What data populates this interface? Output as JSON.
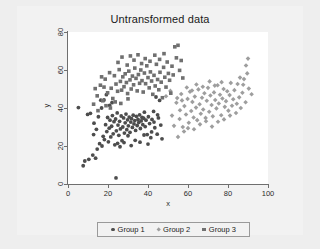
{
  "figure": {
    "background_color": "#eeeeee",
    "canvas_color": "#f2f2f2",
    "plot_color": "#ffffff"
  },
  "chart_data": {
    "type": "scatter",
    "title": "Untransformed data",
    "xlabel": "x",
    "ylabel": "y",
    "xlim": [
      0,
      100
    ],
    "ylim": [
      0,
      80
    ],
    "xticks": [
      0,
      20,
      40,
      60,
      80,
      100
    ],
    "yticks": [
      0,
      20,
      40,
      60,
      80
    ],
    "grid": false,
    "legend_position": "bottom",
    "series": [
      {
        "name": "Group 1",
        "marker": "circle",
        "color": "#4d4d4d",
        "points": [
          [
            5.2,
            40.2
          ],
          [
            7.6,
            9.6
          ],
          [
            8.4,
            12.1
          ],
          [
            9.8,
            36.6
          ],
          [
            10.4,
            13.0
          ],
          [
            11.2,
            37.2
          ],
          [
            12.4,
            15.2
          ],
          [
            13.0,
            32.0
          ],
          [
            13.8,
            13.6
          ],
          [
            14.6,
            18.4
          ],
          [
            15.2,
            35.4
          ],
          [
            15.8,
            21.2
          ],
          [
            16.4,
            44.1
          ],
          [
            17.0,
            20.0
          ],
          [
            17.6,
            25.1
          ],
          [
            18.2,
            23.4
          ],
          [
            18.8,
            31.2
          ],
          [
            19.4,
            27.6
          ],
          [
            19.8,
            35.0
          ],
          [
            20.2,
            22.2
          ],
          [
            20.6,
            29.4
          ],
          [
            21.0,
            33.6
          ],
          [
            21.4,
            24.8
          ],
          [
            21.8,
            30.4
          ],
          [
            22.2,
            36.0
          ],
          [
            22.6,
            26.4
          ],
          [
            23.0,
            32.8
          ],
          [
            23.4,
            20.6
          ],
          [
            23.8,
            34.2
          ],
          [
            24.0,
            3.2
          ],
          [
            24.2,
            28.0
          ],
          [
            24.6,
            37.4
          ],
          [
            25.0,
            31.0
          ],
          [
            25.4,
            25.6
          ],
          [
            25.8,
            33.0
          ],
          [
            26.2,
            29.0
          ],
          [
            26.6,
            35.8
          ],
          [
            27.0,
            22.8
          ],
          [
            27.4,
            30.0
          ],
          [
            27.8,
            34.8
          ],
          [
            28.2,
            26.8
          ],
          [
            28.6,
            32.2
          ],
          [
            29.0,
            36.8
          ],
          [
            29.4,
            28.6
          ],
          [
            29.8,
            33.8
          ],
          [
            30.2,
            30.6
          ],
          [
            30.6,
            35.2
          ],
          [
            31.0,
            27.2
          ],
          [
            31.4,
            32.6
          ],
          [
            31.8,
            34.4
          ],
          [
            32.2,
            29.8
          ],
          [
            32.6,
            36.2
          ],
          [
            33.0,
            31.6
          ],
          [
            33.4,
            33.4
          ],
          [
            33.8,
            28.2
          ],
          [
            34.2,
            35.6
          ],
          [
            34.6,
            30.8
          ],
          [
            35.0,
            34.0
          ],
          [
            35.4,
            32.4
          ],
          [
            35.8,
            36.4
          ],
          [
            36.2,
            29.2
          ],
          [
            36.6,
            33.2
          ],
          [
            37.0,
            35.0
          ],
          [
            37.4,
            31.2
          ],
          [
            37.8,
            34.6
          ],
          [
            38.2,
            37.8
          ],
          [
            38.6,
            30.2
          ],
          [
            39.0,
            33.6
          ],
          [
            39.6,
            26.0
          ],
          [
            40.2,
            35.4
          ],
          [
            40.8,
            31.8
          ],
          [
            41.4,
            24.4
          ],
          [
            42.0,
            34.0
          ],
          [
            42.8,
            38.2
          ],
          [
            43.4,
            29.6
          ],
          [
            44.0,
            45.8
          ],
          [
            44.6,
            26.2
          ],
          [
            45.2,
            34.8
          ],
          [
            45.8,
            44.0
          ],
          [
            46.4,
            31.0
          ],
          [
            47.0,
            23.8
          ],
          [
            12.8,
            26.0
          ],
          [
            14.2,
            28.8
          ],
          [
            16.8,
            40.0
          ],
          [
            18.0,
            44.2
          ],
          [
            19.2,
            47.0
          ],
          [
            20.8,
            41.4
          ],
          [
            22.0,
            42.8
          ],
          [
            24.8,
            21.4
          ],
          [
            26.0,
            19.6
          ],
          [
            28.0,
            21.8
          ],
          [
            30.0,
            25.4
          ],
          [
            31.6,
            20.2
          ],
          [
            33.6,
            23.0
          ],
          [
            36.0,
            22.0
          ],
          [
            38.0,
            25.8
          ],
          [
            40.0,
            21.0
          ],
          [
            41.8,
            27.4
          ],
          [
            43.0,
            32.6
          ],
          [
            44.8,
            36.4
          ]
        ]
      },
      {
        "name": "Group 2",
        "marker": "diamond",
        "color": "#9e9e9e",
        "points": [
          [
            49.0,
            46.2
          ],
          [
            51.2,
            49.0
          ],
          [
            53.0,
            30.6
          ],
          [
            54.2,
            42.8
          ],
          [
            55.0,
            24.8
          ],
          [
            55.8,
            34.2
          ],
          [
            56.6,
            47.4
          ],
          [
            57.4,
            30.0
          ],
          [
            58.2,
            41.0
          ],
          [
            59.0,
            36.6
          ],
          [
            59.8,
            44.8
          ],
          [
            60.4,
            32.2
          ],
          [
            61.0,
            48.6
          ],
          [
            61.6,
            38.4
          ],
          [
            62.2,
            43.2
          ],
          [
            62.8,
            35.0
          ],
          [
            63.4,
            46.0
          ],
          [
            64.0,
            40.2
          ],
          [
            64.6,
            33.6
          ],
          [
            65.2,
            49.8
          ],
          [
            65.8,
            42.0
          ],
          [
            66.4,
            37.0
          ],
          [
            67.0,
            45.4
          ],
          [
            67.6,
            39.2
          ],
          [
            68.2,
            47.8
          ],
          [
            68.8,
            34.8
          ],
          [
            69.4,
            43.8
          ],
          [
            70.0,
            50.6
          ],
          [
            70.6,
            38.0
          ],
          [
            71.2,
            46.6
          ],
          [
            71.8,
            41.6
          ],
          [
            72.4,
            35.6
          ],
          [
            73.0,
            48.2
          ],
          [
            73.6,
            44.2
          ],
          [
            74.2,
            39.8
          ],
          [
            74.8,
            52.0
          ],
          [
            75.4,
            42.4
          ],
          [
            76.0,
            47.0
          ],
          [
            76.6,
            36.2
          ],
          [
            77.2,
            45.0
          ],
          [
            77.8,
            50.0
          ],
          [
            78.4,
            40.6
          ],
          [
            79.0,
            43.6
          ],
          [
            79.6,
            48.8
          ],
          [
            80.2,
            38.6
          ],
          [
            80.8,
            46.8
          ],
          [
            81.4,
            53.2
          ],
          [
            82.0,
            41.2
          ],
          [
            82.6,
            44.6
          ],
          [
            83.2,
            49.4
          ],
          [
            84.0,
            37.4
          ],
          [
            84.8,
            52.6
          ],
          [
            85.6,
            45.6
          ],
          [
            86.4,
            40.0
          ],
          [
            87.2,
            48.0
          ],
          [
            88.0,
            55.2
          ],
          [
            88.8,
            43.0
          ],
          [
            89.6,
            58.2
          ],
          [
            90.4,
            50.2
          ],
          [
            91.8,
            47.2
          ],
          [
            56.0,
            38.8
          ],
          [
            58.0,
            27.6
          ],
          [
            60.0,
            29.4
          ],
          [
            63.0,
            28.8
          ],
          [
            66.0,
            31.4
          ],
          [
            69.0,
            33.0
          ],
          [
            72.0,
            30.2
          ],
          [
            75.0,
            32.8
          ],
          [
            78.0,
            34.0
          ],
          [
            81.0,
            36.0
          ],
          [
            84.4,
            42.2
          ],
          [
            86.0,
            56.0
          ],
          [
            89.0,
            62.4
          ],
          [
            90.0,
            66.0
          ],
          [
            87.6,
            52.2
          ],
          [
            64.2,
            52.4
          ],
          [
            67.4,
            51.2
          ],
          [
            70.8,
            54.0
          ],
          [
            73.4,
            51.8
          ],
          [
            76.8,
            53.6
          ],
          [
            52.0,
            36.0
          ],
          [
            54.6,
            45.2
          ],
          [
            57.0,
            44.0
          ],
          [
            59.4,
            50.8
          ],
          [
            62.0,
            49.2
          ]
        ]
      },
      {
        "name": "Group 3",
        "marker": "square",
        "color": "#707070",
        "points": [
          [
            14.6,
            46.4
          ],
          [
            16.2,
            52.0
          ],
          [
            17.4,
            43.8
          ],
          [
            18.6,
            55.2
          ],
          [
            19.8,
            48.0
          ],
          [
            20.8,
            58.6
          ],
          [
            21.6,
            50.4
          ],
          [
            22.4,
            45.0
          ],
          [
            23.2,
            57.0
          ],
          [
            24.0,
            52.6
          ],
          [
            24.8,
            48.8
          ],
          [
            25.6,
            60.2
          ],
          [
            26.2,
            54.0
          ],
          [
            26.8,
            49.4
          ],
          [
            27.4,
            56.4
          ],
          [
            28.0,
            51.2
          ],
          [
            28.6,
            58.0
          ],
          [
            29.2,
            53.4
          ],
          [
            29.8,
            47.6
          ],
          [
            30.4,
            59.4
          ],
          [
            31.0,
            54.8
          ],
          [
            31.6,
            50.0
          ],
          [
            32.2,
            56.8
          ],
          [
            32.8,
            52.2
          ],
          [
            33.4,
            61.0
          ],
          [
            34.0,
            55.6
          ],
          [
            34.6,
            49.0
          ],
          [
            35.2,
            57.6
          ],
          [
            35.8,
            53.0
          ],
          [
            36.4,
            60.0
          ],
          [
            37.0,
            54.4
          ],
          [
            37.6,
            48.4
          ],
          [
            38.2,
            58.4
          ],
          [
            38.8,
            52.8
          ],
          [
            39.4,
            62.2
          ],
          [
            40.0,
            56.0
          ],
          [
            40.6,
            50.6
          ],
          [
            41.2,
            59.0
          ],
          [
            41.8,
            54.2
          ],
          [
            42.4,
            47.2
          ],
          [
            43.0,
            57.2
          ],
          [
            43.6,
            51.6
          ],
          [
            44.2,
            63.0
          ],
          [
            44.8,
            55.0
          ],
          [
            45.4,
            49.6
          ],
          [
            46.0,
            58.8
          ],
          [
            46.6,
            53.6
          ],
          [
            47.2,
            45.4
          ],
          [
            47.8,
            61.4
          ],
          [
            48.4,
            56.2
          ],
          [
            49.0,
            51.0
          ],
          [
            49.6,
            64.2
          ],
          [
            50.2,
            58.2
          ],
          [
            50.8,
            54.6
          ],
          [
            51.4,
            47.8
          ],
          [
            52.0,
            62.0
          ],
          [
            52.6,
            57.4
          ],
          [
            53.4,
            72.2
          ],
          [
            54.2,
            66.4
          ],
          [
            55.0,
            73.0
          ],
          [
            55.8,
            59.8
          ],
          [
            56.6,
            65.0
          ],
          [
            57.4,
            55.8
          ],
          [
            25.0,
            64.0
          ],
          [
            27.0,
            66.8
          ],
          [
            29.6,
            62.6
          ],
          [
            31.2,
            67.4
          ],
          [
            33.0,
            65.2
          ],
          [
            35.0,
            68.0
          ],
          [
            36.8,
            63.4
          ],
          [
            38.6,
            66.0
          ],
          [
            41.0,
            64.6
          ],
          [
            43.4,
            67.8
          ],
          [
            45.8,
            65.6
          ],
          [
            48.0,
            68.6
          ],
          [
            12.8,
            42.0
          ],
          [
            15.0,
            38.6
          ],
          [
            16.8,
            56.4
          ],
          [
            19.0,
            41.2
          ],
          [
            21.2,
            40.0
          ],
          [
            23.6,
            43.2
          ],
          [
            26.4,
            42.4
          ],
          [
            30.0,
            44.8
          ],
          [
            13.6,
            50.2
          ],
          [
            18.0,
            51.0
          ]
        ]
      }
    ]
  },
  "legend": {
    "entries": [
      {
        "label": "Group 1",
        "marker": "circle",
        "color": "#4d4d4d"
      },
      {
        "label": "Group 2",
        "marker": "diamond",
        "color": "#9e9e9e"
      },
      {
        "label": "Group 3",
        "marker": "square",
        "color": "#707070"
      }
    ]
  }
}
